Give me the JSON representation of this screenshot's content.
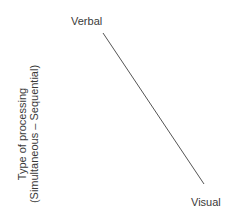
{
  "diagram": {
    "y_axis_label": {
      "line1": "Type of processing",
      "line2": "(Simultaneous – Sequential)"
    },
    "line": {
      "start_label": "Verbal",
      "end_label": "Visual",
      "color": "#555555"
    }
  }
}
